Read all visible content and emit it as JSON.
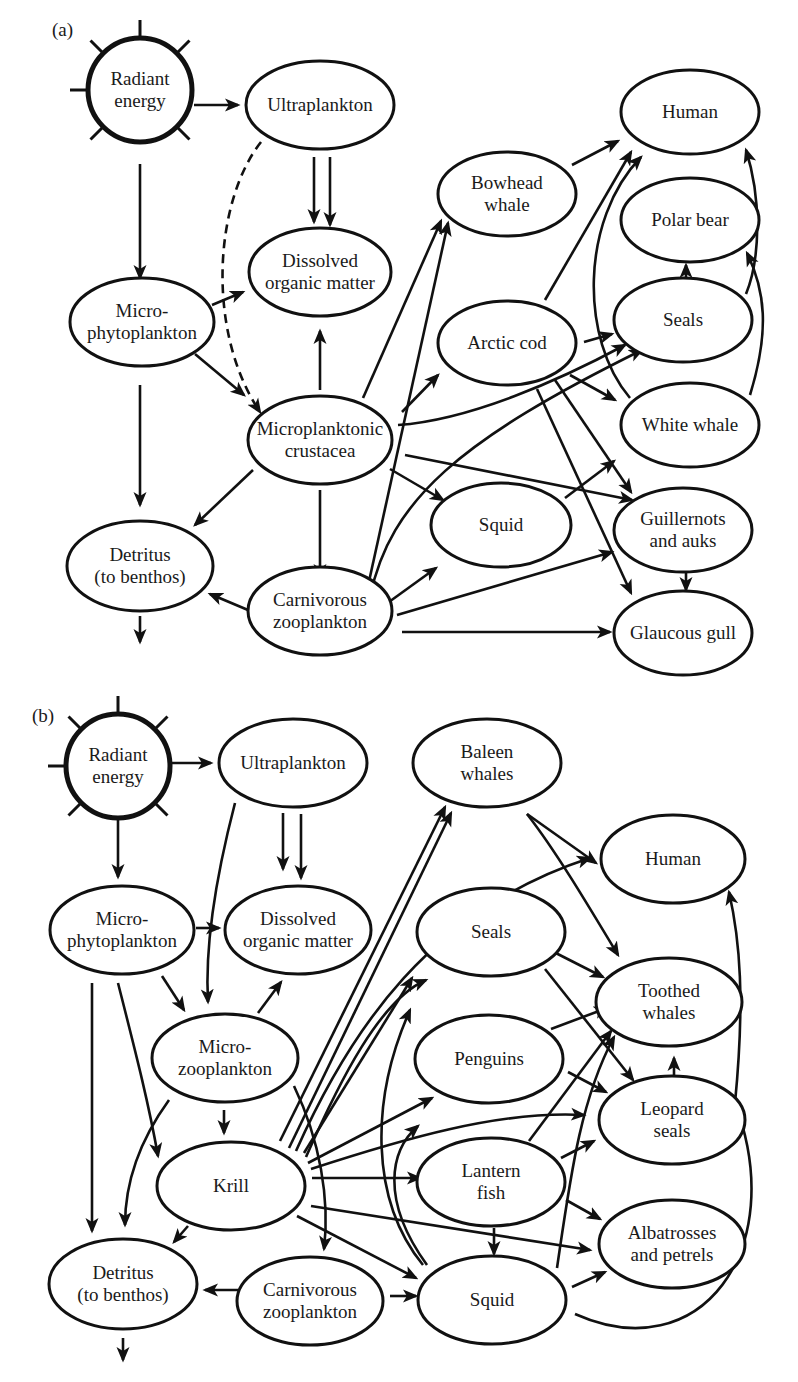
{
  "figure": {
    "type": "food_web_diagram",
    "stroke_color": "#111111",
    "background": "#ffffff"
  },
  "panels": [
    {
      "id": "a",
      "label": "(a)",
      "label_pos": [
        52,
        22
      ],
      "nodes": [
        {
          "id": "radiant",
          "shape": "sun",
          "lines": [
            "Radiant",
            "energy"
          ],
          "cx": 140,
          "cy": 90,
          "r": 52
        },
        {
          "id": "ultra",
          "lines": [
            "Ultraplankton"
          ],
          "cx": 320,
          "cy": 105,
          "rx": 74,
          "ry": 44
        },
        {
          "id": "human",
          "lines": [
            "Human"
          ],
          "cx": 690,
          "cy": 112,
          "rx": 69,
          "ry": 42
        },
        {
          "id": "bowhead",
          "lines": [
            "Bowhead",
            "whale"
          ],
          "cx": 507,
          "cy": 194,
          "rx": 69,
          "ry": 42
        },
        {
          "id": "polar",
          "lines": [
            "Polar bear"
          ],
          "cx": 690,
          "cy": 220,
          "rx": 69,
          "ry": 42
        },
        {
          "id": "dom",
          "lines": [
            "Dissolved",
            "organic matter"
          ],
          "cx": 320,
          "cy": 272,
          "rx": 71,
          "ry": 44
        },
        {
          "id": "microphyto",
          "lines": [
            "Micro-",
            "phytoplankton"
          ],
          "cx": 142,
          "cy": 322,
          "rx": 72,
          "ry": 44
        },
        {
          "id": "cod",
          "lines": [
            "Arctic cod"
          ],
          "cx": 507,
          "cy": 343,
          "rx": 69,
          "ry": 42
        },
        {
          "id": "seals",
          "lines": [
            "Seals"
          ],
          "cx": 683,
          "cy": 320,
          "rx": 69,
          "ry": 42
        },
        {
          "id": "crust",
          "lines": [
            "Microplanktonic",
            "crustacea"
          ],
          "cx": 320,
          "cy": 440,
          "rx": 72,
          "ry": 44
        },
        {
          "id": "whitewhale",
          "lines": [
            "White whale"
          ],
          "cx": 690,
          "cy": 425,
          "rx": 69,
          "ry": 42
        },
        {
          "id": "squid",
          "lines": [
            "Squid"
          ],
          "cx": 501,
          "cy": 525,
          "rx": 70,
          "ry": 42
        },
        {
          "id": "guill",
          "lines": [
            "Guillernots",
            "and auks"
          ],
          "cx": 683,
          "cy": 530,
          "rx": 69,
          "ry": 42
        },
        {
          "id": "detritus",
          "lines": [
            "Detritus",
            "(to benthos)"
          ],
          "cx": 140,
          "cy": 566,
          "rx": 73,
          "ry": 45
        },
        {
          "id": "carni",
          "lines": [
            "Carnivorous",
            "zooplankton"
          ],
          "cx": 320,
          "cy": 611,
          "rx": 72,
          "ry": 44
        },
        {
          "id": "gull",
          "lines": [
            "Glaucous gull"
          ],
          "cx": 683,
          "cy": 633,
          "rx": 69,
          "ry": 42
        }
      ],
      "edges": [
        {
          "d": "M194,105 L238,105"
        },
        {
          "d": "M140,164 L140,278"
        },
        {
          "d": "M314,157 L314,222"
        },
        {
          "d": "M330,157 L330,225",
          "comment": "ultra->dom"
        },
        {
          "d": "M261,142 C215,200 205,330 260,412",
          "dashed": true
        },
        {
          "d": "M212,305 L243,292"
        },
        {
          "d": "M195,354 L244,395"
        },
        {
          "d": "M140,385 L140,505"
        },
        {
          "d": "M320,390 L320,331"
        },
        {
          "d": "M253,470 L195,525"
        },
        {
          "d": "M320,490 L320,577"
        },
        {
          "d": "M248,610 L210,594"
        },
        {
          "d": "M140,616 L140,642"
        },
        {
          "d": "M363,398 L441,221"
        },
        {
          "d": "M402,412 L438,375"
        },
        {
          "d": "M398,425 C470,420 560,380 625,345"
        },
        {
          "d": "M405,455 L632,500"
        },
        {
          "d": "M390,469 L443,500"
        },
        {
          "d": "M366,595 L448,223"
        },
        {
          "d": "M370,597 C390,500 460,440 642,350"
        },
        {
          "d": "M382,607 L436,568"
        },
        {
          "d": "M397,615 L612,552"
        },
        {
          "d": "M402,632 L610,632"
        },
        {
          "d": "M572,165 L618,141"
        },
        {
          "d": "M545,300 L631,152"
        },
        {
          "d": "M584,342 L612,334"
        },
        {
          "d": "M570,375 L615,400"
        },
        {
          "d": "M555,380 L631,492"
        },
        {
          "d": "M537,389 L631,593"
        },
        {
          "d": "M565,498 L614,461"
        },
        {
          "d": "M630,398 C580,340 580,220 641,157"
        },
        {
          "d": "M746,294 C760,260 762,200 746,150"
        },
        {
          "d": "M750,395 C770,330 765,290 747,253"
        },
        {
          "d": "M686,278 L686,265"
        },
        {
          "d": "M686,572 L686,590"
        }
      ]
    },
    {
      "id": "b",
      "label": "(b)",
      "label_pos": [
        32,
        708
      ],
      "nodes": [
        {
          "id": "radiant",
          "shape": "sun",
          "lines": [
            "Radiant",
            "energy"
          ],
          "cx": 118,
          "cy": 766,
          "r": 52
        },
        {
          "id": "ultra",
          "lines": [
            "Ultraplankton"
          ],
          "cx": 293,
          "cy": 763,
          "rx": 74,
          "ry": 44
        },
        {
          "id": "baleen",
          "lines": [
            "Baleen",
            "whales"
          ],
          "cx": 487,
          "cy": 763,
          "rx": 74,
          "ry": 44
        },
        {
          "id": "human",
          "lines": [
            "Human"
          ],
          "cx": 673,
          "cy": 859,
          "rx": 72,
          "ry": 44
        },
        {
          "id": "microphyto",
          "lines": [
            "Micro-",
            "phytoplankton"
          ],
          "cx": 122,
          "cy": 930,
          "rx": 72,
          "ry": 44
        },
        {
          "id": "dom",
          "lines": [
            "Dissolved",
            "organic matter"
          ],
          "cx": 298,
          "cy": 930,
          "rx": 73,
          "ry": 44
        },
        {
          "id": "seals",
          "lines": [
            "Seals"
          ],
          "cx": 491,
          "cy": 932,
          "rx": 74,
          "ry": 44
        },
        {
          "id": "toothed",
          "lines": [
            "Toothed",
            "whales"
          ],
          "cx": 669,
          "cy": 1002,
          "rx": 73,
          "ry": 44
        },
        {
          "id": "microzoo",
          "lines": [
            "Micro-",
            "zooplankton"
          ],
          "cx": 225,
          "cy": 1058,
          "rx": 73,
          "ry": 44
        },
        {
          "id": "penguins",
          "lines": [
            "Penguins"
          ],
          "cx": 489,
          "cy": 1059,
          "rx": 74,
          "ry": 44
        },
        {
          "id": "leopard",
          "lines": [
            "Leopard",
            "seals"
          ],
          "cx": 672,
          "cy": 1120,
          "rx": 73,
          "ry": 44
        },
        {
          "id": "krill",
          "lines": [
            "Krill"
          ],
          "cx": 231,
          "cy": 1186,
          "rx": 74,
          "ry": 44
        },
        {
          "id": "lantern",
          "lines": [
            "Lantern",
            "fish"
          ],
          "cx": 491,
          "cy": 1182,
          "rx": 74,
          "ry": 44
        },
        {
          "id": "albatross",
          "lines": [
            "Albatrosses",
            "and petrels"
          ],
          "cx": 672,
          "cy": 1244,
          "rx": 73,
          "ry": 44
        },
        {
          "id": "detritus",
          "lines": [
            "Detritus",
            "(to benthos)"
          ],
          "cx": 123,
          "cy": 1284,
          "rx": 74,
          "ry": 45
        },
        {
          "id": "carni",
          "lines": [
            "Carnivorous",
            "zooplankton"
          ],
          "cx": 310,
          "cy": 1301,
          "rx": 73,
          "ry": 44
        },
        {
          "id": "squid",
          "lines": [
            "Squid"
          ],
          "cx": 492,
          "cy": 1300,
          "rx": 74,
          "ry": 44
        }
      ],
      "edges": [
        {
          "d": "M172,763 L211,763"
        },
        {
          "d": "M118,820 L118,877"
        },
        {
          "d": "M283,813 L283,869"
        },
        {
          "d": "M301,814 L301,878",
          "comment": "ultra->dom"
        },
        {
          "d": "M235,803 C215,880 205,950 208,1002"
        },
        {
          "d": "M196,928 L219,928"
        },
        {
          "d": "M162,976 L184,1010"
        },
        {
          "d": "M258,1013 L281,982"
        },
        {
          "d": "M92,983 L92,1231"
        },
        {
          "d": "M118,983 C135,1050 148,1100 158,1156"
        },
        {
          "d": "M169,1100 C140,1140 125,1180 125,1225"
        },
        {
          "d": "M224,1110 L224,1133"
        },
        {
          "d": "M188,1226 L174,1242"
        },
        {
          "d": "M294,1086 C320,1140 330,1200 324,1249"
        },
        {
          "d": "M238,1290 L205,1290"
        },
        {
          "d": "M390,1296 L416,1296"
        },
        {
          "d": "M280,1141 L445,807"
        },
        {
          "d": "M289,1148 L451,813"
        },
        {
          "d": "M296,1151 C350,1030 430,910 590,858"
        },
        {
          "d": "M304,1153 L412,978"
        },
        {
          "d": "M306,1157 C340,1080 380,1000 426,980"
        },
        {
          "d": "M308,1163 L432,1098"
        },
        {
          "d": "M311,1169 C400,1140 500,1110 584,1115"
        },
        {
          "d": "M312,1178 L420,1178"
        },
        {
          "d": "M311,1206 L590,1250"
        },
        {
          "d": "M297,1216 L416,1278"
        },
        {
          "d": "M427,1265 C380,1200 390,1150 418,1126"
        },
        {
          "d": "M423,1265 C370,1200 370,1100 410,1010"
        },
        {
          "d": "M527,814 L596,863"
        },
        {
          "d": "M527,814 C555,850 585,900 618,955"
        },
        {
          "d": "M542,946 L603,977"
        },
        {
          "d": "M545,969 L633,1080"
        },
        {
          "d": "M551,1029 L607,1008"
        },
        {
          "d": "M568,1072 L606,1092"
        },
        {
          "d": "M529,1141 L611,1031"
        },
        {
          "d": "M561,1158 L594,1141"
        },
        {
          "d": "M566,1200 L600,1219"
        },
        {
          "d": "M494,1228 L494,1254"
        },
        {
          "d": "M557,1268 C570,1180 580,1100 614,1037"
        },
        {
          "d": "M572,1287 L605,1272"
        },
        {
          "d": "M575,1314 C700,1370 790,1250 735,1103 C745,1000 740,940 729,892"
        },
        {
          "d": "M674,1075 L674,1058"
        },
        {
          "d": "M123,1338 L123,1360"
        }
      ]
    }
  ]
}
